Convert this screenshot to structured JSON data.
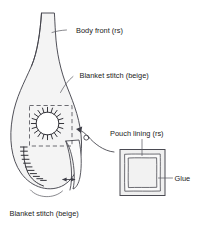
{
  "figure": {
    "background_color": "#ffffff",
    "line_color": "#3d3d46",
    "fill_color": "#f4f4f4",
    "text_color": "#1a1a1a"
  },
  "labels": {
    "body_front": "Body front (rs)",
    "blanket_stitch_top": "Blanket stitch (beige)",
    "blanket_stitch_bottom": "Blanket stitch (beige)",
    "pouch_lining": "Pouch lining (rs)",
    "glue": "Glue"
  },
  "parts": {
    "body_front": {
      "name": "body-front-shape",
      "description": "teardrop bottle shaped fabric piece, right side up"
    },
    "opening": {
      "name": "circular-opening",
      "description": "round hole edged with blanket stitch",
      "stitch_count": 20
    },
    "placement_box": {
      "name": "pouch-placement-box",
      "description": "dashed square marking pouch lining placement"
    },
    "edge_stitching": {
      "name": "edge-blanket-stitching",
      "description": "blanket stitch worked along lower left edge",
      "stitch_count": 11
    },
    "flap": {
      "name": "side-flap",
      "description": "folded side flap with seam allowance arrow"
    },
    "pouch_lining": {
      "name": "pouch-lining-square",
      "description": "square lining piece with glued border",
      "layers": 3
    }
  }
}
